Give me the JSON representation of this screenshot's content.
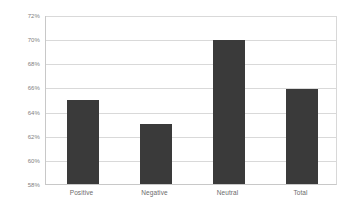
{
  "chart_data": {
    "type": "bar",
    "title": "",
    "subtitle": "",
    "xlabel": "",
    "ylabel": "",
    "categories": [
      "Positive",
      "Negative",
      "Neutral",
      "Total"
    ],
    "values": [
      65.0,
      63.0,
      69.9,
      65.9
    ],
    "value_labels": [
      "65%",
      "63%",
      "70%",
      "66%"
    ],
    "ylim": [
      58,
      72
    ],
    "ytick_values": [
      58,
      60,
      62,
      64,
      66,
      68,
      70,
      72
    ],
    "ytick_labels": [
      "58%",
      "60%",
      "62%",
      "64%",
      "66%",
      "68%",
      "70%",
      "72%"
    ],
    "grid": true,
    "legend": false,
    "legend_position": "none",
    "series": [
      {
        "name": "",
        "values": [
          65.0,
          63.0,
          69.9,
          65.9
        ]
      }
    ],
    "colors": {
      "bar": "#3a3a3a",
      "gridline": "#d9d9d9",
      "axis": "#c8c8c8",
      "tick_text": "#808080",
      "category_text": "#6b6b6b",
      "background": "#ffffff"
    }
  }
}
